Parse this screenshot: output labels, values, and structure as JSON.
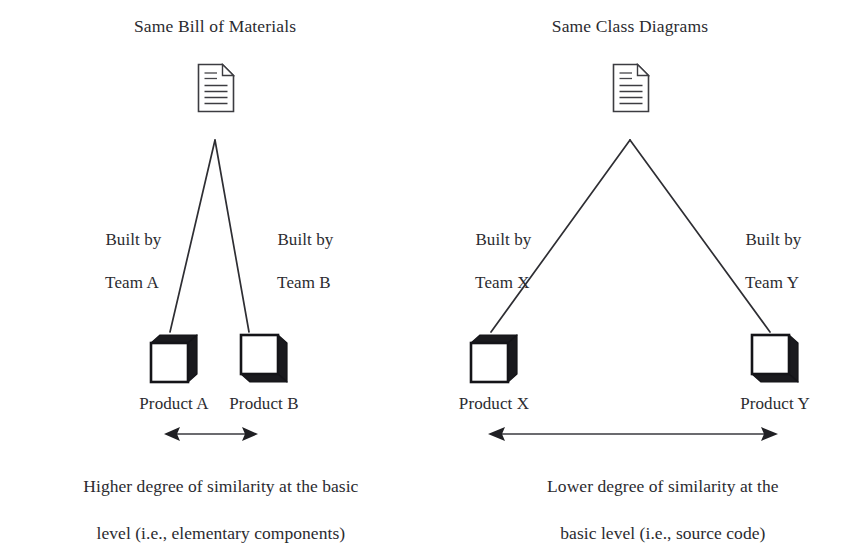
{
  "diagram": {
    "background_color": "#ffffff",
    "ink_color": "#2b2b30"
  },
  "panels": [
    {
      "id": "left",
      "title": "Same Bill of Materials",
      "root_icon": "document-icon",
      "edges": [
        {
          "id": "left-a",
          "label_line1": "Built by",
          "label_line2": "Team A"
        },
        {
          "id": "left-b",
          "label_line1": "Built by",
          "label_line2": "Team B"
        }
      ],
      "nodes": [
        {
          "id": "product-a",
          "label": "Product A",
          "icon": "cube-icon-top-right-shaded"
        },
        {
          "id": "product-b",
          "label": "Product B",
          "icon": "cube-icon-right-bottom-shaded"
        }
      ],
      "measure": {
        "icon": "double-arrow-icon",
        "caption_line1": "Higher degree of similarity at the basic",
        "caption_line2": "level (i.e., elementary components)"
      }
    },
    {
      "id": "right",
      "title": "Same Class Diagrams",
      "root_icon": "document-icon",
      "edges": [
        {
          "id": "right-x",
          "label_line1": "Built by",
          "label_line2": "Team X"
        },
        {
          "id": "right-y",
          "label_line1": "Built by",
          "label_line2": "Team Y"
        }
      ],
      "nodes": [
        {
          "id": "product-x",
          "label": "Product X",
          "icon": "cube-icon-top-right-shaded"
        },
        {
          "id": "product-y",
          "label": "Product Y",
          "icon": "cube-icon-right-bottom-shaded"
        }
      ],
      "measure": {
        "icon": "double-arrow-icon",
        "caption_line1": "Lower degree of similarity at the",
        "caption_line2": "basic level (i.e., source code)"
      }
    }
  ]
}
